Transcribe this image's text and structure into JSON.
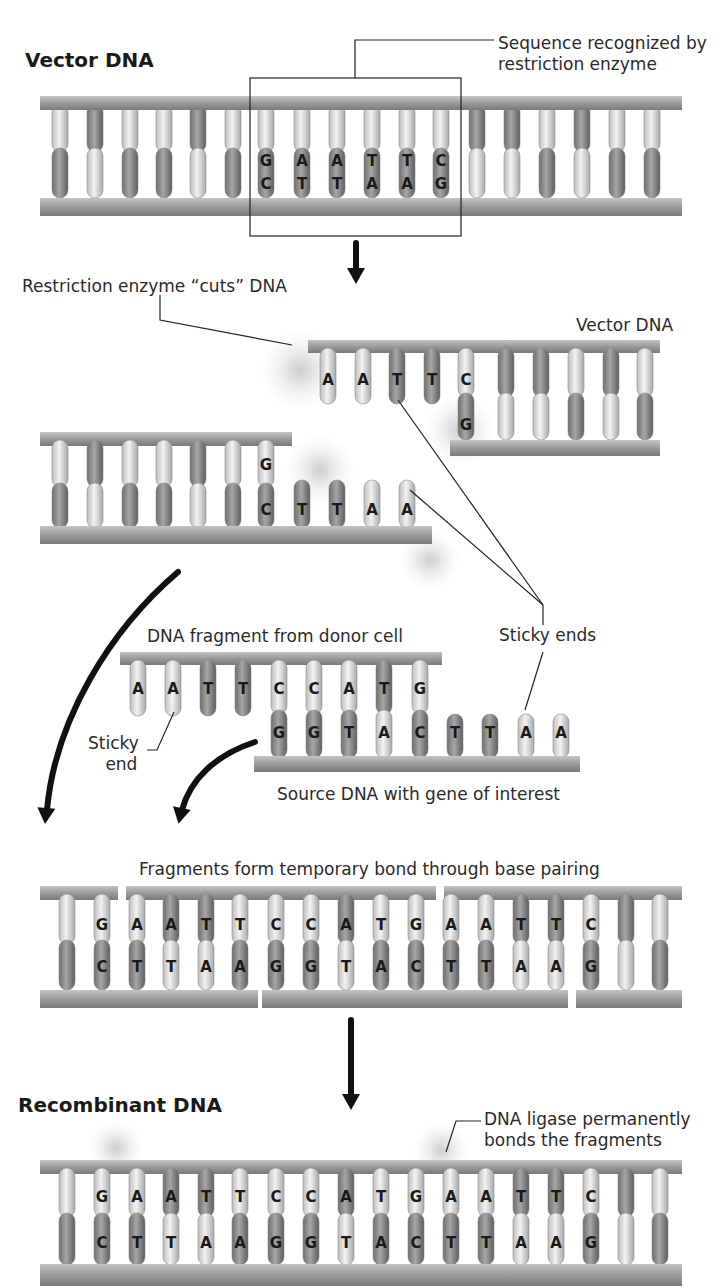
{
  "titles": {
    "vector_dna": "Vector DNA",
    "recombinant_dna": "Recombinant DNA"
  },
  "labels": {
    "recognition_sequence_line1": "Sequence recognized by",
    "recognition_sequence_line2": "restriction enzyme",
    "enzyme_cuts": "Restriction enzyme “cuts” DNA",
    "vector_dna_small": "Vector DNA",
    "donor_fragment": "DNA fragment from donor cell",
    "sticky_ends": "Sticky ends",
    "sticky_end_line1": "Sticky",
    "sticky_end_line2": "end",
    "source_dna": "Source DNA with gene of interest",
    "temporary_bond": "Fragments form temporary bond through base pairing",
    "ligase_line1": "DNA ligase permanently",
    "ligase_line2": "bonds the fragments"
  },
  "sequences": {
    "recognition_top": [
      "G",
      "A",
      "A",
      "T",
      "T",
      "C"
    ],
    "recognition_bottom": [
      "C",
      "T",
      "T",
      "A",
      "A",
      "G"
    ],
    "cut_right_top": [
      "A",
      "A",
      "T",
      "T",
      "C"
    ],
    "cut_right_bottom": [
      "G"
    ],
    "cut_left_top": [
      "G"
    ],
    "cut_left_bottom": [
      "C",
      "T",
      "T",
      "A",
      "A"
    ],
    "donor_top": [
      "A",
      "A",
      "T",
      "T",
      "C",
      "C",
      "A",
      "T",
      "G"
    ],
    "donor_bottom": [
      "G",
      "G",
      "T",
      "A",
      "C",
      "T",
      "T",
      "A",
      "A"
    ],
    "joined_top": [
      "G",
      "A",
      "A",
      "T",
      "T",
      "C",
      "C",
      "A",
      "T",
      "G",
      "A",
      "A",
      "T",
      "T",
      "C"
    ],
    "joined_bottom": [
      "C",
      "T",
      "T",
      "A",
      "A",
      "G",
      "G",
      "T",
      "A",
      "C",
      "T",
      "T",
      "A",
      "A",
      "G"
    ]
  },
  "colors": {
    "backbone": "#9a9a9a",
    "backbone_dark": "#777777",
    "base_light": "#d8d8d8",
    "base_dark": "#8c8c8c",
    "glow": "#cfcfcf",
    "arrow": "#111111"
  }
}
